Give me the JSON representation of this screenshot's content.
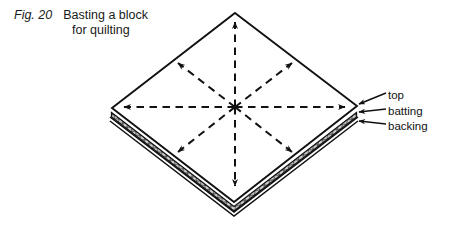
{
  "caption": {
    "figure_label": "Fig. 20",
    "title_line1": "Basting a block",
    "title_line2": "for quilting"
  },
  "diagram": {
    "name": "quilt-block-basting-diagram",
    "shape": "diamond",
    "labels": [
      {
        "id": "top",
        "text": "top"
      },
      {
        "id": "batting",
        "text": "batting"
      },
      {
        "id": "backing",
        "text": "backing"
      }
    ],
    "colors": {
      "line": "#111111",
      "batting_fill": "#c9c9c9",
      "background": "#ffffff"
    },
    "basting_arrows": 8
  }
}
